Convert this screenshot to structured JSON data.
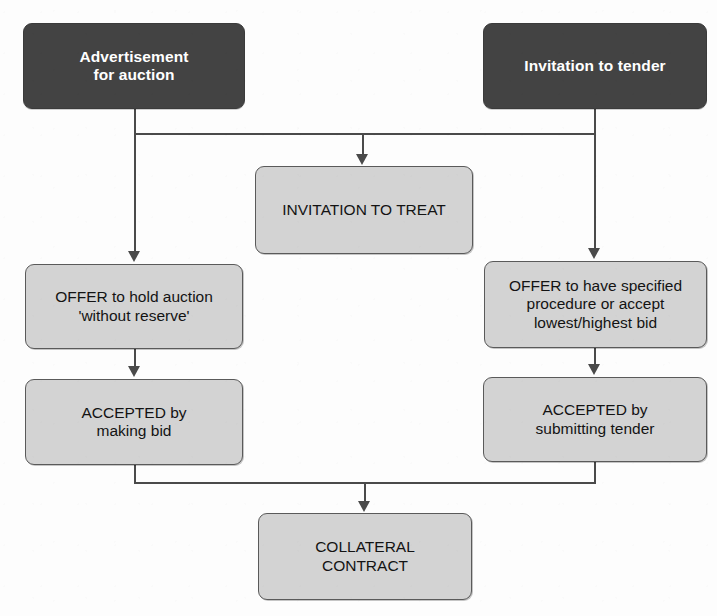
{
  "diagram": {
    "colors": {
      "dark_box_fill": "#434343",
      "dark_box_text": "#ffffff",
      "light_box_fill": "#d3d3d3",
      "light_box_border": "#5a5a5a",
      "light_box_text": "#131313",
      "connector": "#4a4a4a",
      "background": "#fdfdfd"
    },
    "nodes": [
      {
        "id": "advertisement-for-auction",
        "style": "dark",
        "label": "Advertisement\nfor auction",
        "x": 23,
        "y": 23,
        "w": 222,
        "h": 86
      },
      {
        "id": "invitation-to-tender",
        "style": "dark",
        "label": "Invitation to tender",
        "x": 483,
        "y": 23,
        "w": 224,
        "h": 86
      },
      {
        "id": "invitation-to-treat",
        "style": "light",
        "label": "INVITATION TO TREAT",
        "x": 255,
        "y": 166,
        "w": 218,
        "h": 88
      },
      {
        "id": "offer-to-hold-auction",
        "style": "light",
        "label": "OFFER to hold auction\n'without reserve'",
        "x": 25,
        "y": 264,
        "w": 218,
        "h": 85
      },
      {
        "id": "offer-specified-procedure",
        "style": "light",
        "label": "OFFER to have specified\nprocedure or accept\nlowest/highest bid",
        "x": 484,
        "y": 261,
        "w": 223,
        "h": 87
      },
      {
        "id": "accepted-by-making-bid",
        "style": "light",
        "label": "ACCEPTED by\nmaking bid",
        "x": 25,
        "y": 379,
        "w": 218,
        "h": 86
      },
      {
        "id": "accepted-by-submitting-tender",
        "style": "light",
        "label": "ACCEPTED by\nsubmitting tender",
        "x": 483,
        "y": 377,
        "w": 224,
        "h": 85
      },
      {
        "id": "collateral-contract",
        "style": "light",
        "label": "COLLATERAL\nCONTRACT",
        "x": 258,
        "y": 513,
        "w": 214,
        "h": 87
      }
    ],
    "connectors": [
      {
        "id": "advert-down-to-junction",
        "from": "advertisement-for-auction",
        "to": "junction-top"
      },
      {
        "id": "tender-down-to-junction",
        "from": "invitation-to-tender",
        "to": "junction-top"
      },
      {
        "id": "junction-top-to-invitation-to-treat",
        "from": "junction-top",
        "to": "invitation-to-treat",
        "arrow": true
      },
      {
        "id": "advert-to-offer-auction",
        "from": "advertisement-for-auction",
        "to": "offer-to-hold-auction",
        "arrow": true
      },
      {
        "id": "tender-to-offer-specified",
        "from": "invitation-to-tender",
        "to": "offer-specified-procedure",
        "arrow": true
      },
      {
        "id": "offer-auction-to-accepted-bid",
        "from": "offer-to-hold-auction",
        "to": "accepted-by-making-bid",
        "arrow": true
      },
      {
        "id": "offer-specified-to-accepted-tender",
        "from": "offer-specified-procedure",
        "to": "accepted-by-submitting-tender",
        "arrow": true
      },
      {
        "id": "accepted-bid-down-to-junction",
        "from": "accepted-by-making-bid",
        "to": "junction-bottom"
      },
      {
        "id": "accepted-tender-down-to-junction",
        "from": "accepted-by-submitting-tender",
        "to": "junction-bottom"
      },
      {
        "id": "junction-bottom-to-collateral",
        "from": "junction-bottom",
        "to": "collateral-contract",
        "arrow": true
      }
    ]
  }
}
